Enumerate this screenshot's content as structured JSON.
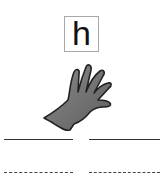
{
  "card": {
    "letter": "h",
    "image": "hand-icon",
    "writing_lines": [
      {
        "type": "solid",
        "side": "left"
      },
      {
        "type": "solid",
        "side": "right"
      },
      {
        "type": "dashed",
        "side": "left"
      },
      {
        "type": "dashed",
        "side": "right"
      }
    ]
  }
}
